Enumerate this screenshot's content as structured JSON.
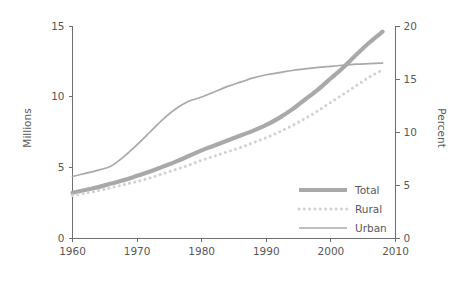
{
  "chart_data": {
    "type": "line",
    "title": "",
    "subtitle": "",
    "xlabel": "",
    "ylabel": "Millions",
    "y2label": "Percent",
    "xlim": [
      1960,
      2010
    ],
    "ylim": [
      0,
      15
    ],
    "y2lim": [
      0,
      20
    ],
    "grid": false,
    "legend_position": "inside-lower-right",
    "x_ticks": [
      1960,
      1970,
      1980,
      1990,
      2000,
      2010
    ],
    "x_tick_labels": [
      "1960",
      "1970",
      "1980",
      "1990",
      "2000",
      "2010"
    ],
    "y_ticks": [
      0,
      5,
      10,
      15
    ],
    "y_tick_labels": [
      "0",
      "5",
      "10",
      "15"
    ],
    "y2_ticks": [
      0,
      5,
      10,
      15,
      20
    ],
    "y2_tick_labels": [
      "0",
      "5",
      "10",
      "15",
      "20"
    ],
    "series": [
      {
        "name": "Total",
        "axis": "left",
        "units": "Millions",
        "style": "thick-solid",
        "color": "#a9a9ab",
        "x": [
          1960,
          1962,
          1964,
          1966,
          1968,
          1970,
          1972,
          1974,
          1976,
          1978,
          1980,
          1982,
          1984,
          1986,
          1988,
          1990,
          1992,
          1994,
          1996,
          1998,
          2000,
          2002,
          2004,
          2006,
          2008
        ],
        "values": [
          3.2,
          3.4,
          3.6,
          3.85,
          4.1,
          4.4,
          4.7,
          5.05,
          5.4,
          5.8,
          6.2,
          6.55,
          6.9,
          7.25,
          7.6,
          8.0,
          8.5,
          9.1,
          9.8,
          10.5,
          11.3,
          12.1,
          13.0,
          13.85,
          14.6
        ]
      },
      {
        "name": "Rural",
        "axis": "left",
        "units": "Millions",
        "style": "dotted",
        "color": "#d2d2d4",
        "x": [
          1960,
          1962,
          1964,
          1966,
          1968,
          1970,
          1972,
          1974,
          1976,
          1978,
          1980,
          1982,
          1984,
          1986,
          1988,
          1990,
          1992,
          1994,
          1996,
          1998,
          2000,
          2002,
          2004,
          2006,
          2008
        ],
        "values": [
          3.0,
          3.18,
          3.35,
          3.55,
          3.78,
          4.0,
          4.25,
          4.55,
          4.85,
          5.15,
          5.5,
          5.8,
          6.1,
          6.4,
          6.75,
          7.1,
          7.5,
          7.95,
          8.45,
          9.0,
          9.6,
          10.2,
          10.8,
          11.4,
          11.9
        ]
      },
      {
        "name": "Urban",
        "axis": "right",
        "units": "Percent",
        "style": "thin-solid",
        "color": "#a9a9ab",
        "x": [
          1960,
          1962,
          1964,
          1966,
          1968,
          1970,
          1972,
          1974,
          1976,
          1978,
          1980,
          1982,
          1984,
          1986,
          1988,
          1990,
          1992,
          1994,
          1996,
          1998,
          2000,
          2002,
          2004,
          2006,
          2008
        ],
        "values": [
          5.8,
          6.1,
          6.4,
          6.8,
          7.7,
          8.8,
          10.0,
          11.2,
          12.2,
          12.9,
          13.3,
          13.8,
          14.3,
          14.7,
          15.1,
          15.4,
          15.6,
          15.8,
          15.95,
          16.1,
          16.2,
          16.3,
          16.4,
          16.45,
          16.5
        ]
      }
    ],
    "legend": [
      {
        "label": "Total",
        "color": "#a9a9ab",
        "style": "thick-solid"
      },
      {
        "label": "Rural",
        "color": "#d2d2d4",
        "style": "dotted"
      },
      {
        "label": "Urban",
        "color": "#a9a9ab",
        "style": "thin-solid"
      }
    ],
    "annotations": []
  }
}
